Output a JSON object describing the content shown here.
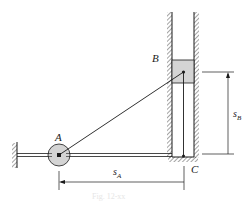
{
  "figure": {
    "type": "mechanism-diagram",
    "labels": {
      "point_a": "A",
      "point_b": "B",
      "point_c": "C",
      "dim_sa_main": "s",
      "dim_sa_sub": "A",
      "dim_sb_main": "s",
      "dim_sb_sub": "B"
    },
    "caption": "Fig. 12-xx"
  },
  "colors": {
    "line": "#1a1a1a",
    "fill": "#d4d4d4",
    "background": "#ffffff"
  }
}
